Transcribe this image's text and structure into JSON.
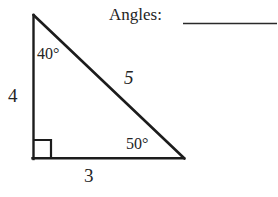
{
  "prompt": {
    "label": "Angles:",
    "answer_blank": ""
  },
  "figure": {
    "type": "right-triangle",
    "stroke_color": "#1c1c1c",
    "vertices": {
      "apex": [
        33,
        15
      ],
      "right_angle": [
        33,
        159
      ],
      "lower_right": [
        184,
        159
      ]
    },
    "right_angle_marker_size": 18
  },
  "labels": {
    "side_vertical": "4",
    "side_horizontal": "3",
    "side_hypotenuse": "5",
    "angle_top": "40°",
    "angle_bottom_right": "50°"
  }
}
